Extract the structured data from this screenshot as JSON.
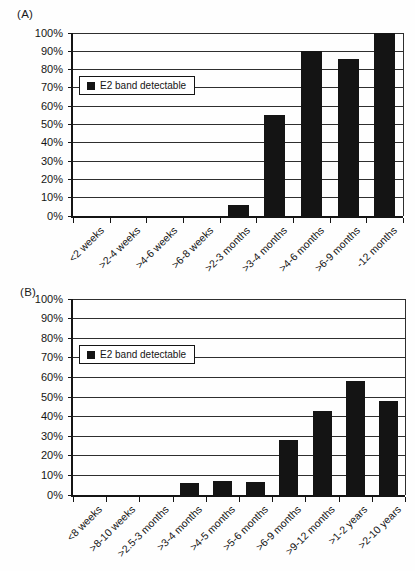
{
  "figure": {
    "background": "#ffffff",
    "bar_color": "#141414",
    "grid_color": "#2e2e2e",
    "text_color": "#151515"
  },
  "chart_data": [
    {
      "type": "bar",
      "panel_label": "(A)",
      "legend_label": "E2 band detectable",
      "legend_marker": "black-square",
      "legend_position": "inside-upper-left",
      "categories": [
        "<2 weeks",
        ">2-4 weeks",
        ">4-6 weeks",
        ">6-8 weeks",
        ">2-3 months",
        ">3-4 months",
        ">4-6 months",
        ">6-9 months",
        "-12 months"
      ],
      "values": [
        0,
        0,
        0,
        0,
        6,
        55,
        90,
        86,
        100
      ],
      "title": "",
      "xlabel": "",
      "ylabel": "",
      "ylim": [
        0,
        100
      ],
      "ytick_step": 10,
      "ytick_suffix": "%",
      "grid": true
    },
    {
      "type": "bar",
      "panel_label": "(B)",
      "legend_label": "E2 band detectable",
      "legend_marker": "black-square",
      "legend_position": "inside-upper-left",
      "categories": [
        "<8 weeks",
        ">8-10 weeks",
        ">2.5-3 months",
        ">3-4 months",
        ">4-5 months",
        ">5-6 months",
        ">6-9 months",
        ">9-12 months",
        ">1-2 years",
        ">2-10 years"
      ],
      "values": [
        0,
        0,
        0,
        6,
        7,
        6.5,
        28,
        43,
        58,
        48
      ],
      "title": "",
      "xlabel": "",
      "ylabel": "",
      "ylim": [
        0,
        100
      ],
      "ytick_step": 10,
      "ytick_suffix": "%",
      "grid": true
    }
  ]
}
